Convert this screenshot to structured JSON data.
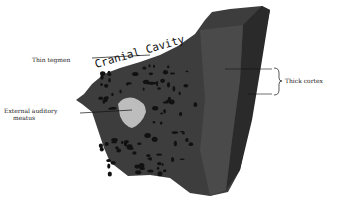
{
  "figure": {
    "handwritten_label": "Cranial Cavity",
    "labels": {
      "thin_tegmen": "Thin tegmen",
      "external_auditory_meatus_line1": "External auditory",
      "external_auditory_meatus_line2": "meatus",
      "thick_cortex": "Thick cortex"
    },
    "colors": {
      "bone_dark": "#2b2b2b",
      "bone_mid": "#4a4a4a",
      "cortex_side": "#3a3a3a",
      "air_cells": "#0f0f0f",
      "meatus": "#bdbdbd",
      "background": "#ffffff"
    }
  }
}
